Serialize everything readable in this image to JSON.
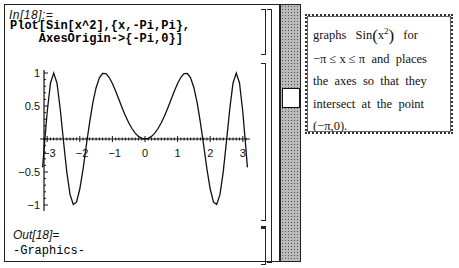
{
  "notebook": {
    "input_label": "In[18]:=",
    "input_code_line1": "Plot[Sin[x^2],{x,-Pi,Pi},",
    "input_code_line2": "    AxesOrigin->{-Pi,0}]",
    "output_label": "Out[18]=",
    "output_value": "-Graphics-"
  },
  "annotation": {
    "line1_a": "graphs",
    "line1_func": "Sin",
    "line1_arg": "x",
    "line1_sup": "2",
    "line1_b": "for",
    "line2": "−π ≤ x ≤ π  and  places",
    "line3": "the  axes  so  that  they",
    "line4": "intersect  at  the  point",
    "line5": "(−π,0)."
  },
  "scrollbar": {
    "thumb_position": "upper-middle"
  },
  "chart_data": {
    "type": "line",
    "title": "",
    "function": "Sin[x^2]",
    "xlabel": "",
    "ylabel": "",
    "xlim": [
      -3.1416,
      3.1416
    ],
    "ylim": [
      -1,
      1
    ],
    "axes_origin": [
      -3.1416,
      0
    ],
    "x_ticks": [
      "-3",
      "-2",
      "-1",
      "0",
      "1",
      "2",
      "3"
    ],
    "y_ticks": [
      "1",
      "0.5",
      "-0.5",
      "-1"
    ],
    "grid": false,
    "x": [
      -3.1416,
      -3.1,
      -3.0,
      -2.9,
      -2.8,
      -2.7,
      -2.6,
      -2.5,
      -2.4,
      -2.3,
      -2.2,
      -2.1,
      -2.0,
      -1.9,
      -1.8,
      -1.7,
      -1.6,
      -1.5,
      -1.4,
      -1.3,
      -1.2,
      -1.1,
      -1.0,
      -0.9,
      -0.8,
      -0.7,
      -0.6,
      -0.5,
      -0.4,
      -0.3,
      -0.2,
      -0.1,
      0,
      0.1,
      0.2,
      0.3,
      0.4,
      0.5,
      0.6,
      0.7,
      0.8,
      0.9,
      1.0,
      1.1,
      1.2,
      1.3,
      1.4,
      1.5,
      1.6,
      1.7,
      1.8,
      1.9,
      2.0,
      2.1,
      2.2,
      2.3,
      2.4,
      2.5,
      2.6,
      2.7,
      2.8,
      2.9,
      3.0,
      3.1,
      3.1416
    ],
    "y": [
      -0.43,
      -0.184,
      0.412,
      0.849,
      1.0,
      0.845,
      0.459,
      -0.033,
      -0.501,
      -0.839,
      -0.991,
      -0.957,
      -0.757,
      -0.452,
      -0.098,
      0.248,
      0.549,
      0.778,
      0.925,
      0.993,
      0.991,
      0.935,
      0.841,
      0.724,
      0.597,
      0.471,
      0.352,
      0.247,
      0.159,
      0.09,
      0.04,
      0.01,
      0,
      0.01,
      0.04,
      0.09,
      0.159,
      0.247,
      0.352,
      0.471,
      0.597,
      0.724,
      0.841,
      0.935,
      0.991,
      0.993,
      0.925,
      0.778,
      0.549,
      0.248,
      -0.098,
      -0.452,
      -0.757,
      -0.957,
      -0.991,
      -0.839,
      -0.501,
      -0.033,
      0.459,
      0.845,
      1.0,
      0.849,
      0.412,
      -0.184,
      -0.43
    ]
  }
}
